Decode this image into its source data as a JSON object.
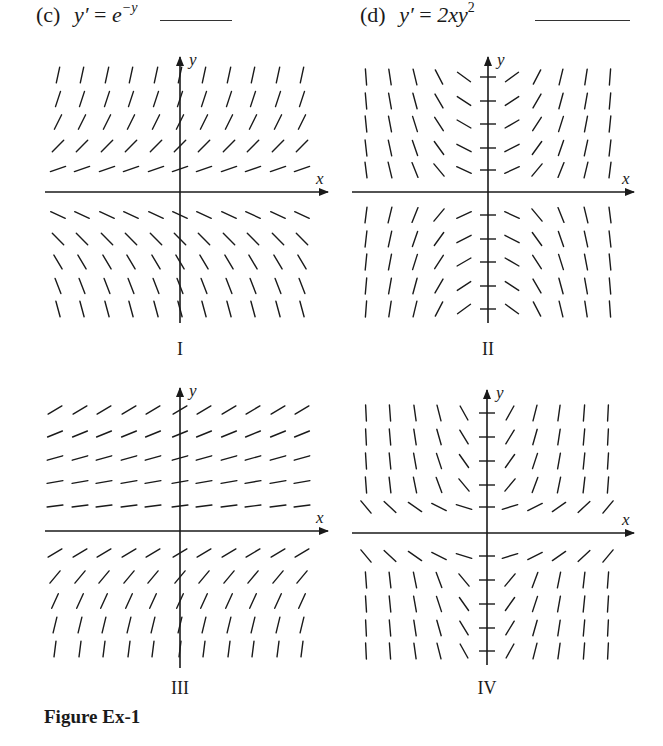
{
  "header": {
    "left": {
      "label": "(c)",
      "lhs": "y′",
      "eq": " = ",
      "base": "e",
      "exp": "−y",
      "answer_blank": ""
    },
    "right": {
      "label": "(d)",
      "lhs": "y′",
      "eq": " = ",
      "expr": "2xy",
      "exp": "2",
      "answer_blank": ""
    }
  },
  "colors": {
    "ink": "#1a1a1a",
    "background": "#ffffff"
  },
  "panels": [
    {
      "id": "I",
      "roman": "I",
      "x_label": "x",
      "y_label": "y",
      "slope_rule": "e^(-y)",
      "y_ticks": false
    },
    {
      "id": "II",
      "roman": "II",
      "x_label": "x",
      "y_label": "y",
      "slope_rule": "x*y^2",
      "y_ticks": true
    },
    {
      "id": "III",
      "roman": "III",
      "x_label": "x",
      "y_label": "y",
      "slope_rule": "e^(-y)-shifted",
      "y_ticks": false
    },
    {
      "id": "IV",
      "roman": "IV",
      "x_label": "x",
      "y_label": "y",
      "slope_rule": "x*y^2-shifted",
      "y_ticks": true
    }
  ],
  "chart_data": [
    {
      "type": "slope-field",
      "title": "I",
      "xlabel": "x",
      "ylabel": "y",
      "grid_columns": 11,
      "rows_above_x_axis": 5,
      "rows_below_x_axis": 5,
      "description": "Slopes steep positive at top, flatten near x-axis (above), negative below, steepening downward; independent of x"
    },
    {
      "type": "slope-field",
      "title": "II",
      "xlabel": "x",
      "ylabel": "y",
      "grid_columns": 10,
      "rows_above_x_axis": 5,
      "rows_below_x_axis": 5,
      "description": "Slopes symmetric about y-axis; upper half: negative left, positive right; lower half: positive left, negative right; horizontal ticks on y-axis"
    },
    {
      "type": "slope-field",
      "title": "III",
      "xlabel": "x",
      "ylabel": "y",
      "grid_columns": 11,
      "rows_above_x_axis": 5,
      "rows_below_x_axis": 5,
      "description": "Nearly horizontal positive slopes at top, steepening downward to near vertical at bottom; independent of x"
    },
    {
      "type": "slope-field",
      "title": "IV",
      "xlabel": "x",
      "ylabel": "y",
      "grid_columns": 10,
      "rows_above_x_axis": 5,
      "rows_below_x_axis": 5,
      "description": "Upper half: negative left, positive right; nearly flat at lowest upper row, steep above; lower half follows same sign pattern; horizontal ticks on y-axis"
    }
  ],
  "panel_labels": [
    "I",
    "II",
    "III",
    "IV"
  ],
  "caption": "Figure Ex-1"
}
